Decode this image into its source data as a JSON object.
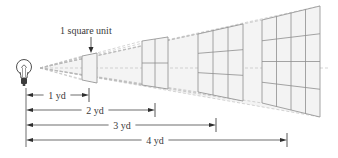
{
  "diagram": {
    "label_unit": "1 square unit",
    "light_source": {
      "icon": "lightbulb-icon",
      "x": 24,
      "y": 68
    },
    "beam_origin": {
      "x": 40,
      "y": 68
    },
    "grids": [
      {
        "distance_yd": 1,
        "divisions": 1,
        "x_left": 82,
        "x_right": 97,
        "y_top_left": 56,
        "y_bot_left": 80,
        "y_top_right": 53,
        "y_bot_right": 83
      },
      {
        "distance_yd": 2,
        "divisions": 2,
        "x_left": 142,
        "x_right": 168,
        "y_top_left": 41,
        "y_bot_left": 85,
        "y_top_right": 37,
        "y_bot_right": 89
      },
      {
        "distance_yd": 3,
        "divisions": 3,
        "x_left": 198,
        "x_right": 243,
        "y_top_left": 34,
        "y_bot_left": 92,
        "y_top_right": 24,
        "y_bot_right": 101
      },
      {
        "distance_yd": 4,
        "divisions": 4,
        "x_left": 262,
        "x_right": 320,
        "y_top_left": 20,
        "y_bot_left": 103,
        "y_top_right": 6,
        "y_bot_right": 117
      }
    ],
    "dimensions": [
      {
        "label": "1 yd",
        "x_start": 26,
        "x_end": 89,
        "y": 95,
        "label_x": 57
      },
      {
        "label": "2 yd",
        "x_start": 26,
        "x_end": 155,
        "y": 110,
        "label_x": 95
      },
      {
        "label": "3 yd",
        "x_start": 26,
        "x_end": 216,
        "y": 125,
        "label_x": 122
      },
      {
        "label": "4 yd",
        "x_start": 26,
        "x_end": 287,
        "y": 140,
        "label_x": 155
      }
    ],
    "dimension_base_x": 26,
    "colors": {
      "grid_stroke": "#8e8e8e",
      "grid_fill": "#f3f3f3",
      "beam": "#b8b8b8",
      "dimension": "#2e2e2e",
      "text": "#3a3a3a"
    }
  }
}
